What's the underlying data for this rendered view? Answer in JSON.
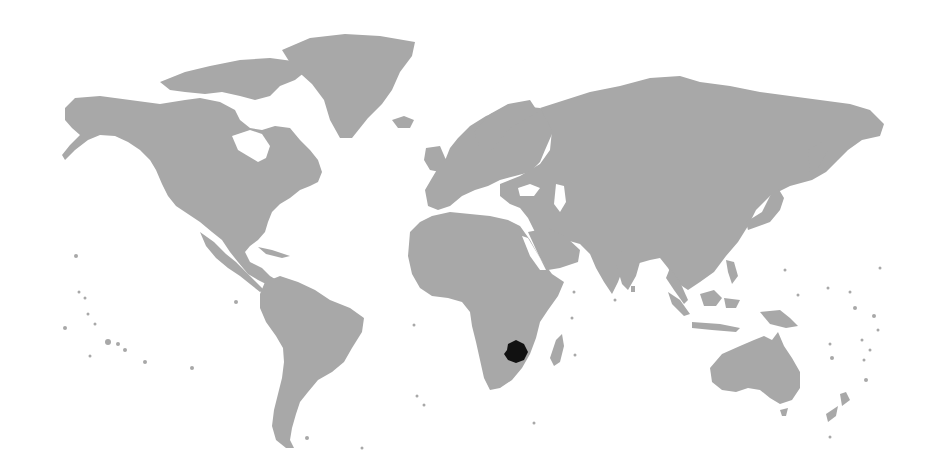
{
  "map": {
    "type": "locator-map",
    "projection": "world",
    "highlighted_country": "Zimbabwe",
    "colors": {
      "background": "#ffffff",
      "land": "#a8a8a8",
      "highlight": "#111111"
    }
  }
}
